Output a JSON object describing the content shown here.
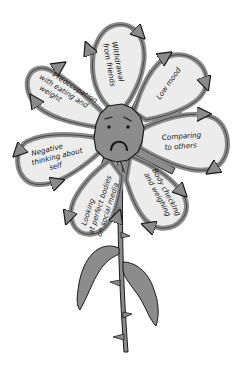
{
  "diagram": {
    "type": "flower-cycle",
    "center": {
      "label": "",
      "expression": "sad-face"
    },
    "petals": [
      {
        "id": "withdrawal",
        "lines": [
          "Withdrawal",
          "from friends"
        ]
      },
      {
        "id": "low-mood",
        "lines": [
          "Low mood"
        ]
      },
      {
        "id": "comparing",
        "lines": [
          "Comparing",
          "to others"
        ]
      },
      {
        "id": "body-checking",
        "lines": [
          "Body checking",
          "and weighing"
        ]
      },
      {
        "id": "social-media",
        "lines": [
          "Looking",
          "at perfect bodies",
          "on social media"
        ]
      },
      {
        "id": "negative-thinking",
        "lines": [
          "Negative",
          "thinking about",
          "self"
        ]
      },
      {
        "id": "preoccupation",
        "lines": [
          "Preoccupation",
          "with eating and",
          "weight"
        ]
      }
    ],
    "colors": {
      "petal_fill": "#ececec",
      "petal_outline": "#8a8a8a",
      "ink": "#1a1a1a",
      "center_fill": "#8c8c8c",
      "stem_fill": "#8c8c8c",
      "background": "#ffffff"
    }
  }
}
